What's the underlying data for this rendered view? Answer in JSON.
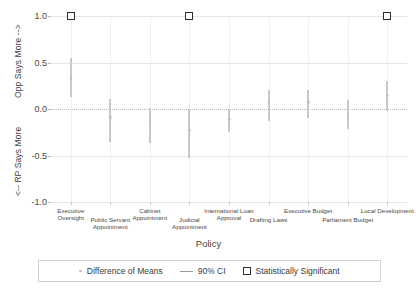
{
  "chart_data": {
    "type": "scatter",
    "title": "",
    "xlabel": "Policy",
    "ylabel_top": "Opp Says More -->",
    "ylabel_bottom": "<-- RP Says More",
    "ylim": [
      -1.0,
      1.0
    ],
    "yticks": [
      "1.0",
      "0.5",
      "0.0",
      "-0.5",
      "-1.0"
    ],
    "ytick_values": [
      1.0,
      0.5,
      0.0,
      -0.5,
      -1.0
    ],
    "grid": true,
    "legend_position": "bottom",
    "categories": [
      "Executive Oversight",
      "Public Servant Appointment",
      "Cabinet Appointment",
      "Judicial Appointment",
      "International Loan Approval",
      "Drafting Laws",
      "Executive Budget",
      "Parliament Budget",
      "Local Development"
    ],
    "series": [
      {
        "name": "Difference of Means",
        "values": [
          0.33,
          -0.09,
          -0.12,
          -0.23,
          -0.11,
          0.06,
          0.07,
          -0.06,
          0.14
        ]
      },
      {
        "name": "90% CI lower",
        "values": [
          0.13,
          -0.35,
          -0.37,
          -0.53,
          -0.25,
          -0.13,
          -0.1,
          -0.21,
          -0.02
        ]
      },
      {
        "name": "90% CI upper",
        "values": [
          0.55,
          0.11,
          0.01,
          0.0,
          0.0,
          0.2,
          0.2,
          0.1,
          0.3
        ]
      }
    ],
    "significant": [
      true,
      false,
      false,
      true,
      false,
      false,
      false,
      false,
      true
    ],
    "significance_marker_y": 1.0
  },
  "legend": {
    "items": [
      {
        "label": "Difference of Means",
        "marker": "dot-marker"
      },
      {
        "label": "90% CI",
        "marker": "line-marker"
      },
      {
        "label": "Statistically Significant",
        "marker": "square-marker"
      }
    ]
  }
}
